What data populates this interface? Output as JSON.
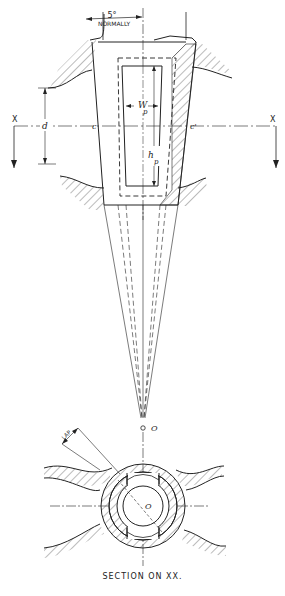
{
  "diagram": {
    "type": "engineering-drawing",
    "labels": {
      "angle": "5°",
      "angle_note": "NORMALLY",
      "section_left": "X",
      "section_right": "X",
      "diameter": "d",
      "centre_left": "c",
      "centre_right": "c'",
      "port_width": "W",
      "port_width_sub": "p",
      "port_height": "h",
      "port_height_sub": "p",
      "apex": "O",
      "plug_centre": "O",
      "lap": "LAP"
    },
    "caption": "SECTION ON XX."
  },
  "colors": {
    "line": "#222222",
    "hatch": "#555555",
    "background": "#ffffff"
  }
}
